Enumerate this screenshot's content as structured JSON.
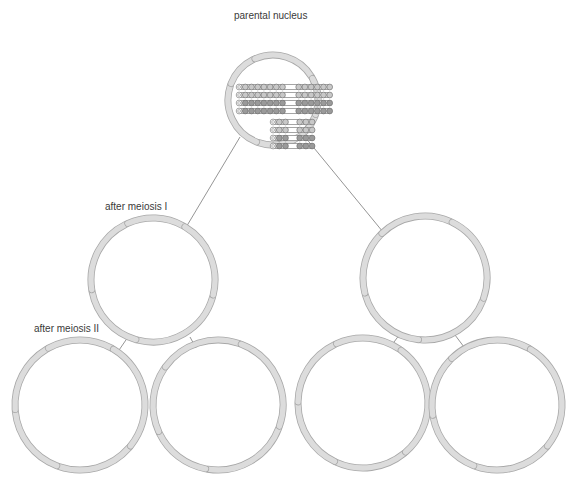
{
  "diagram": {
    "labels": {
      "parental": "parental nucleus",
      "meiosis1": "after meiosis I",
      "meiosis2": "after meiosis II"
    },
    "colors": {
      "envelope_fill": "#dcdcdc",
      "envelope_stroke": "#a8a8a8",
      "line": "#7a7a7a",
      "bead_fill": "#c8c8c8",
      "bead_stroke": "#6a6a6a",
      "bead_dark": "#9a9a9a"
    },
    "nuclei": [
      {
        "id": "parental",
        "cx": 273,
        "cy": 100,
        "r": 45,
        "gaps": [
          200,
          245,
          330,
          20,
          110
        ]
      },
      {
        "id": "m1-left",
        "cx": 153,
        "cy": 280,
        "r": 62,
        "gaps": [
          15,
          105,
          170,
          245,
          300
        ]
      },
      {
        "id": "m1-right",
        "cx": 425,
        "cy": 278,
        "r": 62,
        "gaps": [
          20,
          95,
          165,
          225,
          295
        ]
      },
      {
        "id": "m2-a",
        "cx": 80,
        "cy": 405,
        "r": 65,
        "gaps": [
          40,
          110,
          175,
          240,
          300
        ]
      },
      {
        "id": "m2-b",
        "cx": 218,
        "cy": 405,
        "r": 65,
        "gaps": [
          20,
          100,
          155,
          215,
          290
        ]
      },
      {
        "id": "m2-c",
        "cx": 363,
        "cy": 403,
        "r": 65,
        "gaps": [
          50,
          115,
          180,
          245,
          305
        ]
      },
      {
        "id": "m2-d",
        "cx": 497,
        "cy": 405,
        "r": 65,
        "gaps": [
          40,
          110,
          170,
          225,
          300
        ]
      }
    ],
    "connectors": [
      {
        "x1": 240,
        "y1": 137,
        "x2": 185,
        "y2": 229
      },
      {
        "x1": 305,
        "y1": 137,
        "x2": 383,
        "y2": 232
      },
      {
        "x1": 128,
        "y1": 337,
        "x2": 117,
        "y2": 353
      },
      {
        "x1": 190,
        "y1": 337,
        "x2": 196,
        "y2": 348
      },
      {
        "x1": 400,
        "y1": 334,
        "x2": 391,
        "y2": 346
      },
      {
        "x1": 455,
        "y1": 335,
        "x2": 464,
        "y2": 347
      }
    ],
    "chromosomes": {
      "long_rows": [
        {
          "y": 87,
          "x": 236,
          "left_beads": 8,
          "right_beads": 6,
          "dark": false
        },
        {
          "y": 95,
          "x": 236,
          "left_beads": 8,
          "right_beads": 6,
          "dark": false
        },
        {
          "y": 103,
          "x": 236,
          "left_beads": 8,
          "right_beads": 6,
          "dark": true
        },
        {
          "y": 111,
          "x": 236,
          "left_beads": 8,
          "right_beads": 6,
          "dark": true
        }
      ],
      "short_rows": [
        {
          "y": 122,
          "x": 270,
          "left_beads": 3,
          "right_beads": 3,
          "dark": false
        },
        {
          "y": 130,
          "x": 270,
          "left_beads": 3,
          "right_beads": 3,
          "dark": false
        },
        {
          "y": 138,
          "x": 270,
          "left_beads": 3,
          "right_beads": 3,
          "dark": true
        },
        {
          "y": 146,
          "x": 270,
          "left_beads": 3,
          "right_beads": 3,
          "dark": true
        }
      ]
    }
  }
}
